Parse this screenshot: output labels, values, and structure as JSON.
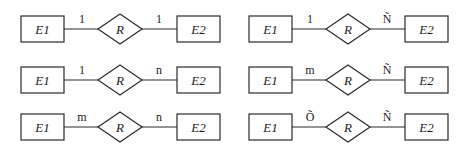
{
  "diagrams": [
    {
      "id": "d1",
      "x": 0,
      "y": 29,
      "left": "E1",
      "rel": "R",
      "right": "E2",
      "card_left": "1",
      "card_right": "1"
    },
    {
      "id": "d2",
      "x": 0,
      "y": 80,
      "left": "E1",
      "rel": "R",
      "right": "E2",
      "card_left": "1",
      "card_right": "n"
    },
    {
      "id": "d3",
      "x": 0,
      "y": 127,
      "left": "E1",
      "rel": "R",
      "right": "E2",
      "card_left": "m",
      "card_right": "n"
    },
    {
      "id": "d4",
      "x": 228,
      "y": 29,
      "left": "E1",
      "rel": "R",
      "right": "E2",
      "card_left": "1",
      "card_right": "Ñ"
    },
    {
      "id": "d5",
      "x": 228,
      "y": 80,
      "left": "E1",
      "rel": "R",
      "right": "E2",
      "card_left": "m",
      "card_right": "Ñ"
    },
    {
      "id": "d6",
      "x": 228,
      "y": 127,
      "left": "E1",
      "rel": "R",
      "right": "E2",
      "card_left": "Õ",
      "card_right": "Ñ"
    }
  ],
  "colors": {
    "stroke": "#2a2a2a",
    "text": "#1a1a1a",
    "background": "#ffffff"
  }
}
